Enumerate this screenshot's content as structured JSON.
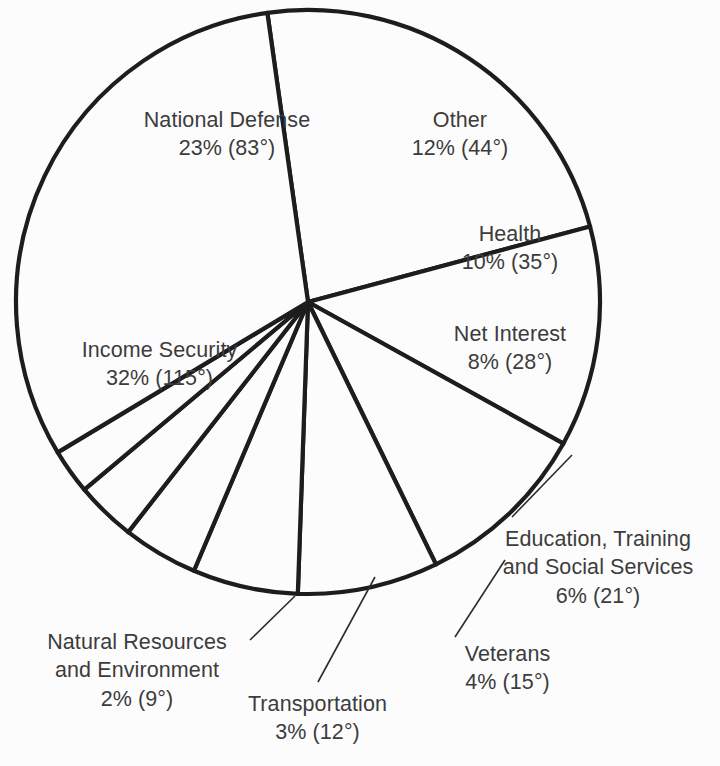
{
  "chart_data": {
    "type": "pie",
    "title": "",
    "subtitle": "",
    "xlabel": "",
    "ylabel": "",
    "legend_position": "none",
    "grid": false,
    "units": "percent",
    "total_degrees": 360,
    "categories": [
      "National Defense",
      "Other",
      "Health",
      "Net Interest",
      "Education, Training and Social Services",
      "Veterans",
      "Transportation",
      "Natural Resources and Environment",
      "Income Security"
    ],
    "values": [
      23,
      12,
      10,
      8,
      6,
      4,
      3,
      2,
      32
    ],
    "degrees": [
      83,
      44,
      35,
      28,
      21,
      15,
      12,
      9,
      115
    ],
    "slices": [
      {
        "name": "National Defense",
        "name_line1": "National Defense",
        "name_line2": "",
        "percent": 23,
        "degrees": 83,
        "value_text": "23% (83°)",
        "label_text": "National Defense",
        "start_deg": 352,
        "end_deg": 75,
        "label_x": 112,
        "label_y": 106,
        "label_width": 230,
        "has_leader": false
      },
      {
        "name": "Other",
        "name_line1": "Other",
        "name_line2": "",
        "percent": 12,
        "degrees": 44,
        "value_text": "12% (44°)",
        "label_text": "Other",
        "start_deg": 75,
        "end_deg": 119,
        "label_x": 375,
        "label_y": 106,
        "label_width": 170,
        "has_leader": false
      },
      {
        "name": "Health",
        "name_line1": "Health",
        "name_line2": "",
        "percent": 10,
        "degrees": 35,
        "value_text": "10% (35°)",
        "label_text": "Health",
        "start_deg": 119,
        "end_deg": 154,
        "label_x": 425,
        "label_y": 220,
        "label_width": 170,
        "has_leader": false
      },
      {
        "name": "Net Interest",
        "name_line1": "Net Interest",
        "name_line2": "",
        "percent": 8,
        "degrees": 28,
        "value_text": "8% (28°)",
        "label_text": "Net Interest",
        "start_deg": 154,
        "end_deg": 182,
        "label_x": 420,
        "label_y": 320,
        "label_width": 180,
        "has_leader": false
      },
      {
        "name": "Education, Training and Social Services",
        "name_line1": "Education, Training",
        "name_line2": "and Social Services",
        "percent": 6,
        "degrees": 21,
        "value_text": "6% (21°)",
        "label_text": "Education, Training and Social Services",
        "start_deg": 182,
        "end_deg": 203,
        "label_x": 483,
        "label_y": 525,
        "label_width": 230,
        "has_leader": true
      },
      {
        "name": "Veterans",
        "name_line1": "Veterans",
        "name_line2": "",
        "percent": 4,
        "degrees": 15,
        "value_text": "4% (15°)",
        "label_text": "Veterans",
        "start_deg": 203,
        "end_deg": 218,
        "label_x": 420,
        "label_y": 640,
        "label_width": 175,
        "has_leader": true
      },
      {
        "name": "Transportation",
        "name_line1": "Transportation",
        "name_line2": "",
        "percent": 3,
        "degrees": 12,
        "value_text": "3% (12°)",
        "label_text": "Transportation",
        "start_deg": 218,
        "end_deg": 230,
        "label_x": 225,
        "label_y": 690,
        "label_width": 185,
        "has_leader": true
      },
      {
        "name": "Natural Resources and Environment",
        "name_line1": "Natural Resources",
        "name_line2": "and Environment",
        "percent": 2,
        "degrees": 9,
        "value_text": "2% (9°)",
        "label_text": "Natural Resources and Environment",
        "start_deg": 230,
        "end_deg": 239,
        "label_x": 22,
        "label_y": 628,
        "label_width": 230,
        "has_leader": true
      },
      {
        "name": "Income Security",
        "name_line1": "Income Security",
        "name_line2": "",
        "percent": 32,
        "degrees": 115,
        "value_text": "32% (115°)",
        "label_text": "Income Security",
        "start_deg": 239,
        "end_deg": 352,
        "label_x": 52,
        "label_y": 336,
        "label_width": 215,
        "has_leader": false
      }
    ],
    "geometry": {
      "center_x": 308,
      "center_y": 302,
      "radius": 292
    },
    "colors": {
      "stroke": "#1d1d1d",
      "fill": "#fcfcfc",
      "text": "#3c3c3c",
      "background": "#fcfcfc",
      "leader": "#2c2c2c"
    },
    "leader_lines": [
      {
        "name": "education-leader",
        "x1": 572,
        "y1": 455,
        "x2": 512,
        "y2": 517
      },
      {
        "name": "veterans-leader",
        "x1": 505,
        "y1": 560,
        "x2": 455,
        "y2": 637
      },
      {
        "name": "transportation-leader",
        "x1": 375,
        "y1": 577,
        "x2": 318,
        "y2": 682
      },
      {
        "name": "natural-resources-leader",
        "x1": 295,
        "y1": 596,
        "x2": 250,
        "y2": 640
      }
    ]
  }
}
